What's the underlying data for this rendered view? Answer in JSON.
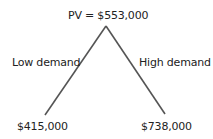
{
  "diagram": {
    "type": "binomial-tree",
    "root": {
      "label": "PV = $553,000"
    },
    "branches": [
      {
        "label": "Low demand",
        "outcome": "$415,000"
      },
      {
        "label": "High demand",
        "outcome": "$738,000"
      }
    ],
    "line_color": "#555555"
  }
}
